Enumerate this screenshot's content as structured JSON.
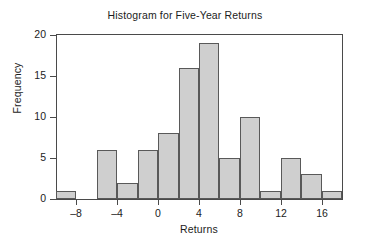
{
  "chart_data": {
    "type": "bar",
    "title": "Histogram for Five-Year Returns",
    "xlabel": "Returns",
    "ylabel": "Frequency",
    "grid": false,
    "legend": "none",
    "xlim": [
      -10,
      18
    ],
    "ylim": [
      0,
      20
    ],
    "bin_width": 2,
    "bin_edges": [
      -10,
      -8,
      -6,
      -4,
      -2,
      0,
      2,
      4,
      6,
      8,
      10,
      12,
      14,
      16,
      18
    ],
    "bin_centers": [
      -9,
      -7,
      -5,
      -3,
      -1,
      1,
      3,
      5,
      7,
      9,
      11,
      13,
      15,
      17
    ],
    "categories": [
      "-10 to -8",
      "-8 to -6",
      "-6 to -4",
      "-4 to -2",
      "-2 to 0",
      "0 to 2",
      "2 to 4",
      "4 to 6",
      "6 to 8",
      "8 to 10",
      "10 to 12",
      "12 to 14",
      "14 to 16",
      "16 to 18"
    ],
    "values": [
      1,
      0,
      6,
      2,
      6,
      8,
      16,
      19,
      5,
      10,
      1,
      5,
      3,
      1
    ],
    "xticks": [
      -8,
      -4,
      0,
      4,
      8,
      12,
      16
    ],
    "xtick_labels": [
      "–8",
      "–4",
      "0",
      "4",
      "8",
      "12",
      "16"
    ],
    "yticks": [
      0,
      5,
      10,
      15,
      20
    ],
    "ytick_labels": [
      "0",
      "5",
      "10",
      "15",
      "20"
    ],
    "total_count": 83,
    "colors": {
      "bar_fill": "#cfcfcf",
      "bar_edge": "#595959",
      "axis": "#4a4a4a",
      "text": "#1c1c1c",
      "background": "#ffffff"
    }
  }
}
